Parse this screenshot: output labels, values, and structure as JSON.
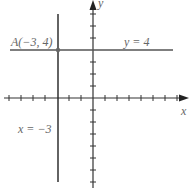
{
  "diagram": {
    "type": "coordinate-plane",
    "axes": {
      "x_label": "x",
      "y_label": "y"
    },
    "lines": [
      {
        "equation": "y = 4",
        "orientation": "horizontal",
        "value": 4
      },
      {
        "equation": "x = −3",
        "orientation": "vertical",
        "value": -3
      }
    ],
    "point": {
      "label": "A(−3, 4)",
      "x": -3,
      "y": 4
    },
    "colors": {
      "axes": "#333333",
      "line": "#555555",
      "text": "#666666"
    }
  }
}
